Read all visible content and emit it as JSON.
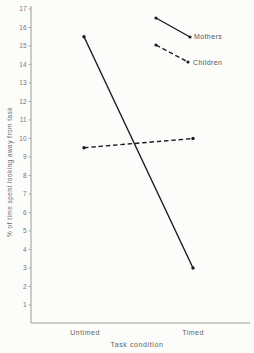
{
  "figure": {
    "background": "#fcfcfa",
    "data_line_color": "#1c1c1c",
    "axis_color": "#9a9a9a",
    "tick_text_color": "#767676"
  },
  "chart_data": {
    "type": "line",
    "title": "",
    "xlabel": "Task condition",
    "ylabel": "% of time spent looking away from task",
    "categories": [
      "Untimed",
      "Timed"
    ],
    "series": [
      {
        "name": "Mothers",
        "values": [
          15.5,
          3
        ],
        "line_style": "solid",
        "marker": "dot"
      },
      {
        "name": "Children",
        "values": [
          9.5,
          10
        ],
        "line_style": "dashed",
        "marker": "dot"
      }
    ],
    "ylim": [
      0,
      17
    ],
    "yticks": [
      1,
      2,
      3,
      4,
      5,
      6,
      7,
      8,
      9,
      10,
      11,
      12,
      13,
      14,
      15,
      16,
      17
    ],
    "grid": false,
    "legend_position": "top-right"
  }
}
